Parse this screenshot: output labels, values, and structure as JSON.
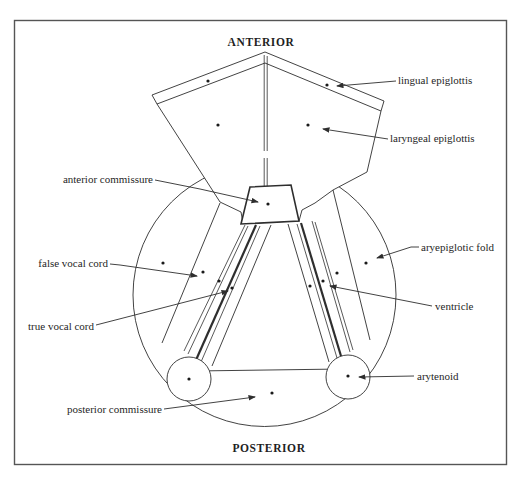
{
  "figure": {
    "orientation_top": "ANTERIOR",
    "orientation_bottom": "POSTERIOR",
    "labels": {
      "lingual_epiglottis": "lingual epiglottis",
      "laryngeal_epiglottis": "laryngeal epiglottis",
      "anterior_commissure": "anterior commissure",
      "false_vocal_cord": "false vocal cord",
      "true_vocal_cord": "true vocal cord",
      "aryepiglotic_fold": "aryepiglotic fold",
      "ventricle": "ventricle",
      "arytenoid": "arytenoid",
      "posterior_commissure": "posterior commissure"
    },
    "colors": {
      "line": "#2e2e2e",
      "text": "#1f1f1f",
      "frame": "#555555",
      "background": "#ffffff"
    }
  }
}
